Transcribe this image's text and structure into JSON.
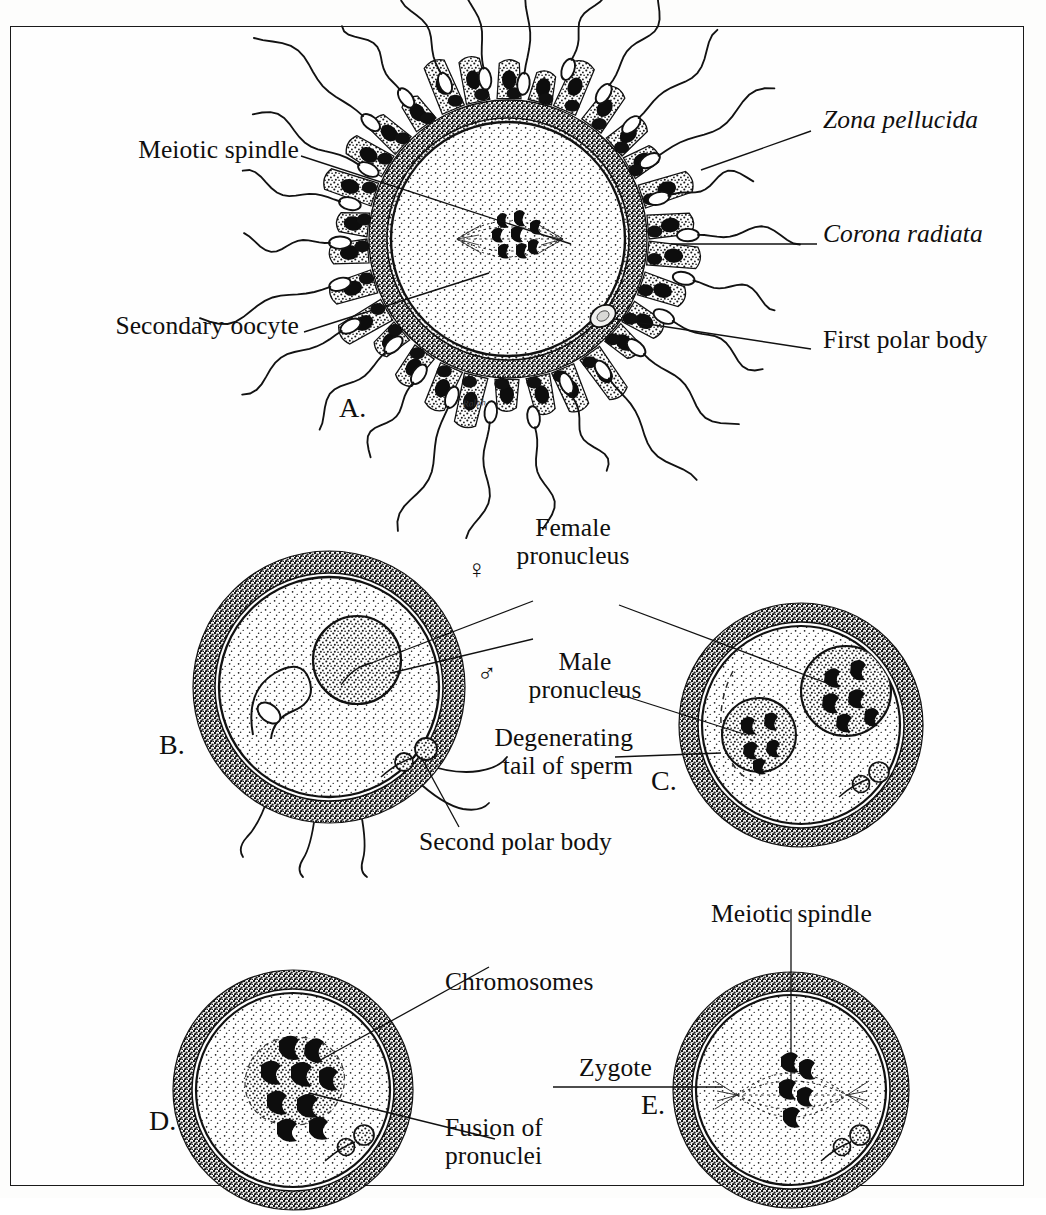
{
  "figure": {
    "border_color": "#1a1a1a",
    "background_color": "#fefefe",
    "ink_color": "#100f0e",
    "signature": "Ralph"
  },
  "panels": [
    {
      "id": "A",
      "letter": "A.",
      "caption": "Secondary oocyte surrounded by corona radiata and many sperm"
    },
    {
      "id": "B",
      "letter": "B.",
      "caption": "Sperm has entered oocyte; female pronucleus forming; second polar body extruded"
    },
    {
      "id": "C",
      "letter": "C.",
      "caption": "Male and female pronuclei with chromosomes; sperm tail degenerating"
    },
    {
      "id": "D",
      "letter": "D.",
      "caption": "Pronuclei fusing; chromosomes intermingling"
    },
    {
      "id": "E",
      "letter": "E.",
      "caption": "Zygote with first mitotic spindle"
    }
  ],
  "labels": {
    "meiotic_spindle_a": "Meiotic spindle",
    "secondary_oocyte": "Secondary oocyte",
    "zona_pellucida": "Zona pellucida",
    "corona_radiata": "Corona radiata",
    "first_polar_body": "First polar body",
    "female_pronucleus_line1": "Female",
    "female_pronucleus_line2": "pronucleus",
    "male_pronucleus_line1": "Male",
    "male_pronucleus_line2": "pronucleus",
    "degenerating_line1": "Degenerating",
    "degenerating_line2": "tail of sperm",
    "second_polar_body": "Second polar body",
    "chromosomes": "Chromosomes",
    "fusion_line1": "Fusion of",
    "fusion_line2": "pronuclei",
    "meiotic_spindle_e": "Meiotic spindle",
    "zygote": "Zygote"
  },
  "symbols": {
    "female": "♀",
    "male": "♂"
  },
  "italic_terms": [
    "Zona pellucida",
    "Corona radiata"
  ]
}
